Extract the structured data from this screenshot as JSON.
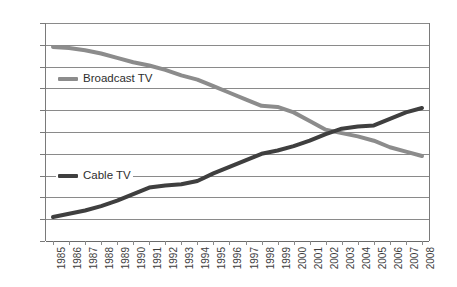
{
  "chart_data": {
    "type": "line",
    "title": "",
    "xlabel": "",
    "ylabel": "",
    "ylim": [
      0,
      100
    ],
    "ytick_step": 10,
    "yticks": [
      100,
      90,
      80,
      70,
      60,
      50,
      40,
      30,
      20,
      10,
      0
    ],
    "grid": true,
    "legend_position": "inside-left",
    "categories": [
      "1985",
      "1986",
      "1987",
      "1988",
      "1989",
      "1990",
      "1991",
      "1992",
      "1993",
      "1994",
      "1995",
      "1996",
      "1997",
      "1998",
      "1999",
      "2000",
      "2001",
      "2002",
      "2003",
      "2004",
      "2005",
      "2006",
      "2007",
      "2008"
    ],
    "series": [
      {
        "name": "Broadcast TV",
        "color": "#8c8c8c",
        "values": [
          89,
          88.5,
          87.5,
          86,
          84,
          82,
          80.5,
          78.5,
          76,
          74,
          71,
          68,
          65,
          62,
          61.5,
          59,
          55,
          51,
          49.5,
          48,
          46,
          43,
          41,
          39
        ]
      },
      {
        "name": "Cable TV",
        "color": "#3f3f3f",
        "values": [
          11,
          12.5,
          14,
          16,
          18.5,
          21.5,
          24.5,
          25.5,
          26,
          27.5,
          31,
          34,
          37,
          40,
          41.5,
          43.5,
          46,
          49,
          51.5,
          52.5,
          53,
          56,
          59,
          61
        ]
      }
    ]
  },
  "legend": {
    "broadcast": "Broadcast TV",
    "cable": "Cable TV"
  },
  "colors": {
    "broadcast": "#8c8c8c",
    "cable": "#3f3f3f",
    "grid": "#8a8a8a",
    "axis": "#7a7a7a",
    "text": "#3d3d3d",
    "background": "#ffffff"
  }
}
